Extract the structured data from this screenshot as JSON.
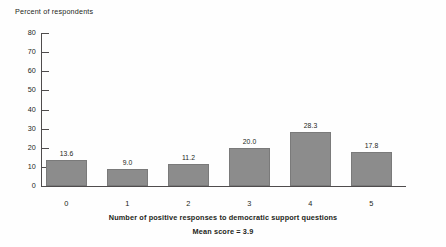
{
  "chart_data": {
    "type": "bar",
    "title": "",
    "ylabel": "Percent of respondents",
    "xlabel": "Number of positive responses to democratic support questions",
    "subcaption": "Mean score = 3.9",
    "categories": [
      "0",
      "1",
      "2",
      "3",
      "4",
      "5"
    ],
    "values": [
      13.6,
      9.0,
      11.2,
      20.0,
      28.3,
      17.8
    ],
    "value_labels": [
      "13.6",
      "9.0",
      "11.2",
      "20.0",
      "28.3",
      "17.8"
    ],
    "ylim": [
      0,
      80
    ],
    "yticks": [
      80,
      70,
      60,
      50,
      40,
      30,
      20,
      10,
      0
    ],
    "ytick_labels": [
      "80",
      "70",
      "60",
      "50",
      "40",
      "30",
      "20",
      "10",
      "0"
    ],
    "grid": false,
    "legend": false,
    "bar_color": "#8c8c8c",
    "bar_edge_color": "#7a7a7a",
    "axis_color": "#4f4c4d",
    "text_color": "#231f20",
    "background_color": "#fefefe"
  }
}
